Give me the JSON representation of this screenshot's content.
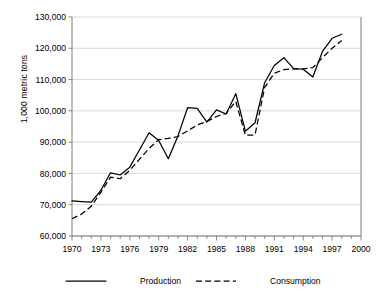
{
  "chart_data": {
    "type": "line",
    "title": "",
    "xlabel": "",
    "ylabel": "1,000 metric tons",
    "xlim": [
      1970,
      2000
    ],
    "ylim": [
      60000,
      130000
    ],
    "grid": "horizontal",
    "legend_position": "bottom",
    "y_ticks": [
      60000,
      70000,
      80000,
      90000,
      100000,
      110000,
      120000,
      130000
    ],
    "y_tick_labels": [
      "60,000",
      "70,000",
      "80,000",
      "90,000",
      "100,000",
      "110,000",
      "120,000",
      "130,000"
    ],
    "x_ticks": [
      1970,
      1973,
      1976,
      1979,
      1982,
      1985,
      1988,
      1991,
      1994,
      1997,
      2000
    ],
    "x_tick_labels": [
      "1970",
      "1973",
      "1976",
      "1979",
      "1982",
      "1985",
      "1988",
      "1991",
      "1994",
      "1997",
      "2000"
    ],
    "x_minor_tick_interval": 1,
    "x": [
      1970,
      1971,
      1972,
      1973,
      1974,
      1975,
      1976,
      1977,
      1978,
      1979,
      1980,
      1981,
      1982,
      1983,
      1984,
      1985,
      1986,
      1987,
      1988,
      1989,
      1990,
      1991,
      1992,
      1993,
      1994,
      1995,
      1996,
      1997,
      1998
    ],
    "series": [
      {
        "name": "Production",
        "style": "solid",
        "color": "#000000",
        "values": [
          71200,
          71000,
          70800,
          74600,
          80200,
          79500,
          82000,
          87500,
          93000,
          90500,
          84700,
          92000,
          101000,
          100800,
          96400,
          100300,
          99000,
          105500,
          93500,
          96200,
          109000,
          114500,
          117000,
          113500,
          113300,
          110800,
          119000,
          123200,
          124500
        ]
      },
      {
        "name": "Consumption",
        "style": "dashed",
        "color": "#000000",
        "values": [
          65500,
          67000,
          69500,
          74000,
          78800,
          78300,
          81000,
          84500,
          88000,
          90800,
          91200,
          91800,
          93600,
          95500,
          96600,
          98200,
          99200,
          103000,
          92200,
          92300,
          107500,
          112000,
          113200,
          113400,
          113400,
          113800,
          117000,
          120000,
          122500
        ]
      }
    ]
  },
  "legend": {
    "items": [
      {
        "label": "Production",
        "style": "solid"
      },
      {
        "label": "Consumption",
        "style": "dashed"
      }
    ]
  }
}
